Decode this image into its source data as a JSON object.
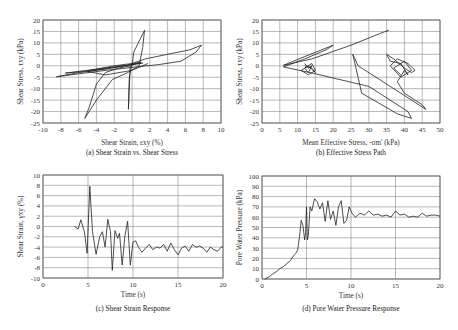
{
  "chart_data": [
    {
      "id": "a",
      "type": "line",
      "title": "",
      "caption": "(a) Shear Strain vs. Shear Stress",
      "xlabel": "Shear Strain, εxy (%)",
      "ylabel": "Shear Stress, τxy (kPa)",
      "xlim": [
        -10,
        10
      ],
      "ylim": [
        -25,
        20
      ],
      "xticks": [
        -10,
        -8,
        -6,
        -4,
        -2,
        0,
        2,
        4,
        6,
        8,
        10
      ],
      "yticks": [
        -25,
        -20,
        -15,
        -10,
        -5,
        0,
        5,
        10,
        15,
        20
      ],
      "grid": true,
      "series": [
        {
          "name": "stress-strain loop",
          "x": [
            0,
            0.2,
            1.4,
            1.2,
            0.8,
            -0.5,
            -2.2,
            -4.0,
            -5.3,
            -4.8,
            -4.0,
            -3.0,
            -1.5,
            -0.2,
            -0.4,
            -0.3,
            0.0,
            1.5,
            4.0,
            6.5,
            7.8,
            7.2,
            5.5,
            3.0,
            0.5,
            -3.0,
            -6.0,
            -8.5,
            -6.0,
            -3.0,
            0.0,
            1.0,
            -2.0,
            -5.5,
            -7.5,
            -4.0,
            0.0,
            1.2,
            -1.0,
            -5.0,
            -3.0,
            0.0,
            1.8
          ],
          "y": [
            0,
            6,
            15.5,
            8,
            0,
            -3,
            -6,
            -15,
            -23,
            -18,
            -8,
            -3,
            -1,
            0,
            -19,
            -5,
            1,
            3,
            5,
            7,
            9,
            6,
            2,
            0.5,
            -0.5,
            -2,
            -3.5,
            -4.8,
            -3,
            -1.5,
            0.5,
            1.5,
            0,
            -2.5,
            -3.2,
            -1.5,
            0.5,
            1.2,
            0,
            -2.5,
            -4,
            -2,
            1
          ]
        }
      ]
    },
    {
      "id": "b",
      "type": "line",
      "title": "",
      "caption": "(b) Effective Stress Path",
      "xlabel": "Mean Effective Stress, -σm' (kPa)",
      "ylabel": "Shear Stress, τxy (kPa)",
      "xlim": [
        0,
        50
      ],
      "ylim": [
        -25,
        20
      ],
      "xticks": [
        0,
        5,
        10,
        15,
        20,
        25,
        30,
        35,
        40,
        45,
        50
      ],
      "yticks": [
        -25,
        -20,
        -15,
        -10,
        -5,
        0,
        5,
        10,
        15,
        20
      ],
      "grid": true,
      "series": [
        {
          "name": "effective stress path",
          "x": [
            35,
            35.5,
            33,
            25,
            14,
            6,
            12,
            20,
            18,
            12,
            6,
            15,
            30,
            41,
            42,
            38,
            28,
            25.5,
            27,
            33,
            40,
            46,
            45,
            40,
            38,
            40,
            41,
            39,
            36,
            35,
            37,
            40,
            42,
            43,
            41,
            38,
            36,
            39,
            42,
            40,
            37,
            39
          ],
          "y": [
            15,
            15.5,
            14,
            9,
            3,
            0.2,
            4,
            9,
            7,
            3,
            -0.5,
            -3.5,
            -9,
            -20,
            -23,
            -21,
            -12,
            5,
            0,
            -6,
            -13,
            -19,
            -17,
            -12,
            -7,
            -2,
            -4,
            1,
            2,
            5,
            3,
            -1,
            -3,
            -2,
            1,
            3,
            0,
            -5,
            -2,
            2,
            -1,
            -4
          ]
        },
        {
          "name": "cluster near origin",
          "x": [
            12,
            13,
            14,
            13,
            12,
            14,
            15,
            13,
            11,
            13,
            15,
            14,
            12
          ],
          "y": [
            1,
            -1,
            0,
            -3,
            -1,
            1,
            -2,
            -4,
            -2,
            0,
            -3,
            -1,
            0
          ]
        }
      ]
    },
    {
      "id": "c",
      "type": "line",
      "title": "",
      "caption": "(c) Shear Strain Response",
      "xlabel": "Time (s)",
      "ylabel": "Shear Strain, γxy (%)",
      "xlim": [
        0,
        20
      ],
      "ylim": [
        -10,
        10
      ],
      "xticks": [
        0,
        5,
        10,
        15,
        20
      ],
      "yticks": [
        -10,
        -8,
        -6,
        -4,
        -2,
        0,
        2,
        4,
        6,
        8,
        10
      ],
      "grid": true,
      "series": [
        {
          "name": "shear strain",
          "x": [
            3.5,
            3.9,
            4.2,
            4.6,
            4.9,
            5.2,
            5.5,
            5.9,
            6.3,
            6.6,
            6.9,
            7.2,
            7.5,
            7.7,
            8.0,
            8.3,
            8.5,
            8.8,
            9.1,
            9.4,
            9.7,
            10.0,
            10.3,
            10.6,
            11.0,
            11.4,
            11.8,
            12.2,
            12.6,
            13.0,
            13.4,
            13.8,
            14.2,
            14.6,
            15.0,
            15.4,
            15.8,
            16.2,
            16.6,
            17.0,
            17.4,
            17.8,
            18.2,
            18.6,
            19.0,
            19.4,
            19.8,
            20.0
          ],
          "y": [
            0,
            -0.5,
            1.3,
            -1,
            -5.2,
            7.8,
            -1,
            -5.4,
            -2,
            -1,
            -4,
            1.4,
            -1,
            -8.5,
            -0.8,
            -2.3,
            -1.3,
            -7.5,
            -1.8,
            1.0,
            -7.5,
            -3.0,
            -2.8,
            -4.0,
            -5.0,
            -4.2,
            -3.5,
            -4.5,
            -4.0,
            -4.2,
            -3.5,
            -4.8,
            -3.2,
            -4.5,
            -5.5,
            -4.2,
            -3.8,
            -4.8,
            -3.5,
            -4.0,
            -3.8,
            -4.2,
            -5.0,
            -4.0,
            -4.5,
            -4.8,
            -4.0,
            -4.0
          ]
        }
      ]
    },
    {
      "id": "d",
      "type": "line",
      "title": "",
      "caption": "(d) Pore Water Pressure Response",
      "xlabel": "Time (s)",
      "ylabel": "Pore Water Pressure (kPa)",
      "xlim": [
        0,
        20
      ],
      "ylim": [
        0,
        100
      ],
      "xticks": [
        0,
        5,
        10,
        15,
        20
      ],
      "yticks": [
        0,
        10,
        20,
        30,
        40,
        50,
        60,
        70,
        80,
        90,
        100
      ],
      "grid": true,
      "series": [
        {
          "name": "pore water pressure",
          "x": [
            0.3,
            0.8,
            1.2,
            1.6,
            2.0,
            2.4,
            2.8,
            3.2,
            3.5,
            3.8,
            4.0,
            4.2,
            4.4,
            4.6,
            4.8,
            4.9,
            5.0,
            5.1,
            5.2,
            5.4,
            5.6,
            5.9,
            6.2,
            6.5,
            6.8,
            7.1,
            7.4,
            7.7,
            8.0,
            8.3,
            8.6,
            8.9,
            9.2,
            9.5,
            9.8,
            10.1,
            10.5,
            11.0,
            11.5,
            12.0,
            12.5,
            13.0,
            13.5,
            14.0,
            14.5,
            15.0,
            15.5,
            16.0,
            16.5,
            17.0,
            17.5,
            18.0,
            18.5,
            19.0,
            19.5,
            20.0
          ],
          "y": [
            0,
            2,
            5,
            7,
            10,
            12,
            15,
            18,
            22,
            25,
            28,
            40,
            57,
            52,
            38,
            45,
            70,
            38,
            42,
            70,
            66,
            78,
            75,
            68,
            74,
            56,
            76,
            58,
            66,
            52,
            70,
            76,
            54,
            57,
            70,
            64,
            60,
            64,
            62,
            66,
            62,
            63,
            61,
            62,
            60,
            66,
            62,
            63,
            60,
            61,
            60,
            64,
            61,
            62,
            62,
            61
          ]
        }
      ]
    }
  ]
}
